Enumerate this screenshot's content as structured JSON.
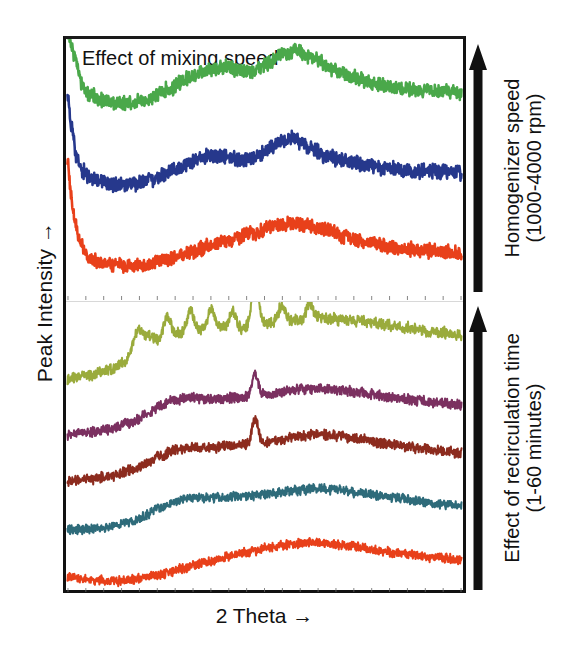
{
  "figure": {
    "title": "Effect of mixing speed",
    "xlabel": "2 Theta →",
    "ylabel": "Peak Intensity  →"
  },
  "annotations": {
    "top": {
      "line1": "Homogenizer speed",
      "line2": "(1000-4000 rpm)",
      "arrow_icon": "up-arrow-icon",
      "direction": "up"
    },
    "bottom": {
      "line1": "Effect of recirculation time",
      "line2": "(1-60 minutes)",
      "arrow_icon": "up-arrow-icon",
      "direction": "up"
    }
  },
  "chart_data": {
    "type": "line",
    "title": "Effect of mixing speed",
    "xlabel": "2 Theta →",
    "ylabel": "Peak Intensity →",
    "grid": false,
    "legend_position": "none",
    "xlim": [
      5,
      60
    ],
    "ylim": [
      0,
      1
    ],
    "axis_tick_labels_shown": false,
    "panels": [
      {
        "name": "Effect of mixing speed",
        "annotation": "Homogenizer speed (1000-4000 rpm)",
        "series": [
          {
            "name": "4000 rpm",
            "color": "#4aa84a",
            "offset": 0.74,
            "noise": 0.022,
            "profile": [
              [
                5,
                0.3
              ],
              [
                6,
                0.2
              ],
              [
                7,
                0.1
              ],
              [
                8,
                0.055
              ],
              [
                10,
                0.03
              ],
              [
                13,
                0.02
              ],
              [
                16,
                0.035
              ],
              [
                19,
                0.075
              ],
              [
                22,
                0.12
              ],
              [
                25,
                0.155
              ],
              [
                27,
                0.165
              ],
              [
                29,
                0.15
              ],
              [
                31,
                0.145
              ],
              [
                33,
                0.175
              ],
              [
                35,
                0.215
              ],
              [
                37,
                0.225
              ],
              [
                39,
                0.2
              ],
              [
                42,
                0.155
              ],
              [
                45,
                0.12
              ],
              [
                48,
                0.095
              ],
              [
                51,
                0.08
              ],
              [
                54,
                0.07
              ],
              [
                57,
                0.065
              ],
              [
                60,
                0.062
              ]
            ]
          },
          {
            "name": "2500 rpm",
            "color": "#26388c",
            "offset": 0.44,
            "noise": 0.024,
            "profile": [
              [
                5,
                0.34
              ],
              [
                5.6,
                0.22
              ],
              [
                6.2,
                0.12
              ],
              [
                7,
                0.055
              ],
              [
                8.5,
                0.02
              ],
              [
                11,
                0.005
              ],
              [
                14,
                0.005
              ],
              [
                17,
                0.022
              ],
              [
                20,
                0.06
              ],
              [
                23,
                0.1
              ],
              [
                25,
                0.118
              ],
              [
                27,
                0.112
              ],
              [
                29,
                0.1
              ],
              [
                31,
                0.105
              ],
              [
                33,
                0.14
              ],
              [
                35,
                0.175
              ],
              [
                36.5,
                0.185
              ],
              [
                38,
                0.16
              ],
              [
                41,
                0.12
              ],
              [
                44,
                0.092
              ],
              [
                47,
                0.075
              ],
              [
                50,
                0.064
              ],
              [
                54,
                0.056
              ],
              [
                57,
                0.052
              ],
              [
                60,
                0.05
              ]
            ]
          },
          {
            "name": "1000 rpm",
            "color": "#e8401a",
            "offset": 0.12,
            "noise": 0.022,
            "profile": [
              [
                5,
                0.42
              ],
              [
                5.5,
                0.28
              ],
              [
                6,
                0.18
              ],
              [
                6.8,
                0.095
              ],
              [
                8,
                0.04
              ],
              [
                10,
                0.012
              ],
              [
                13,
                0.005
              ],
              [
                16,
                0.01
              ],
              [
                19,
                0.03
              ],
              [
                22,
                0.058
              ],
              [
                25,
                0.085
              ],
              [
                28,
                0.11
              ],
              [
                31,
                0.135
              ],
              [
                34,
                0.16
              ],
              [
                36,
                0.172
              ],
              [
                38,
                0.168
              ],
              [
                41,
                0.145
              ],
              [
                44,
                0.118
              ],
              [
                47,
                0.098
              ],
              [
                50,
                0.082
              ],
              [
                54,
                0.068
              ],
              [
                57,
                0.06
              ],
              [
                60,
                0.055
              ]
            ]
          }
        ]
      },
      {
        "name": "Effect of recirculation time",
        "annotation": "Effect of recirculation time (1-60 minutes)",
        "series": [
          {
            "name": "60 minutes",
            "color": "#9aab3c",
            "offset": 0.72,
            "noise": 0.016,
            "crystalline": true,
            "profile": [
              [
                5,
                0.02
              ],
              [
                8,
                0.035
              ],
              [
                11,
                0.055
              ],
              [
                13,
                0.085
              ],
              [
                14.5,
                0.135
              ],
              [
                16,
                0.175
              ],
              [
                17.5,
                0.16
              ],
              [
                19,
                0.195
              ],
              [
                20.5,
                0.18
              ],
              [
                22,
                0.21
              ],
              [
                23.5,
                0.195
              ],
              [
                25,
                0.22
              ],
              [
                26.5,
                0.2
              ],
              [
                28,
                0.215
              ],
              [
                29.5,
                0.195
              ],
              [
                31,
                0.225
              ],
              [
                33,
                0.215
              ],
              [
                35,
                0.235
              ],
              [
                37,
                0.225
              ],
              [
                39,
                0.24
              ],
              [
                42,
                0.23
              ],
              [
                45,
                0.225
              ],
              [
                48,
                0.215
              ],
              [
                52,
                0.2
              ],
              [
                56,
                0.185
              ],
              [
                60,
                0.175
              ]
            ],
            "peaks": [
              [
                14.8,
                0.055
              ],
              [
                18.9,
                0.045
              ],
              [
                22.2,
                0.05
              ],
              [
                25.1,
                0.048
              ],
              [
                28.1,
                0.04
              ],
              [
                31.2,
                0.165
              ],
              [
                34.9,
                0.045
              ],
              [
                38.8,
                0.05
              ]
            ]
          },
          {
            "name": "30 minutes",
            "color": "#7b3060",
            "offset": 0.53,
            "noise": 0.014,
            "crystalline": true,
            "profile": [
              [
                5,
                0.015
              ],
              [
                8,
                0.022
              ],
              [
                11,
                0.035
              ],
              [
                14,
                0.058
              ],
              [
                16,
                0.085
              ],
              [
                18,
                0.118
              ],
              [
                20,
                0.138
              ],
              [
                22,
                0.145
              ],
              [
                25,
                0.142
              ],
              [
                28,
                0.145
              ],
              [
                31,
                0.15
              ],
              [
                34,
                0.16
              ],
              [
                37,
                0.172
              ],
              [
                40,
                0.178
              ],
              [
                43,
                0.172
              ],
              [
                46,
                0.162
              ],
              [
                50,
                0.148
              ],
              [
                54,
                0.135
              ],
              [
                57,
                0.125
              ],
              [
                60,
                0.118
              ]
            ],
            "peaks": [
              [
                31.2,
                0.075
              ]
            ]
          },
          {
            "name": "15 minutes",
            "color": "#8c2b1e",
            "offset": 0.37,
            "noise": 0.014,
            "crystalline": true,
            "profile": [
              [
                5,
                0.012
              ],
              [
                8,
                0.018
              ],
              [
                11,
                0.03
              ],
              [
                14,
                0.05
              ],
              [
                16,
                0.072
              ],
              [
                18,
                0.1
              ],
              [
                20,
                0.122
              ],
              [
                22,
                0.13
              ],
              [
                25,
                0.13
              ],
              [
                28,
                0.136
              ],
              [
                31,
                0.142
              ],
              [
                34,
                0.155
              ],
              [
                37,
                0.168
              ],
              [
                40,
                0.175
              ],
              [
                43,
                0.17
              ],
              [
                46,
                0.158
              ],
              [
                50,
                0.142
              ],
              [
                54,
                0.128
              ],
              [
                57,
                0.118
              ],
              [
                60,
                0.11
              ]
            ],
            "peaks": [
              [
                31.2,
                0.09
              ]
            ]
          },
          {
            "name": "5 minutes",
            "color": "#2e6b7a",
            "offset": 0.2,
            "noise": 0.013,
            "crystalline": false,
            "profile": [
              [
                5,
                0.01
              ],
              [
                8,
                0.014
              ],
              [
                11,
                0.022
              ],
              [
                14,
                0.04
              ],
              [
                16,
                0.062
              ],
              [
                18,
                0.09
              ],
              [
                20,
                0.112
              ],
              [
                22,
                0.122
              ],
              [
                25,
                0.124
              ],
              [
                28,
                0.128
              ],
              [
                31,
                0.132
              ],
              [
                34,
                0.14
              ],
              [
                37,
                0.15
              ],
              [
                40,
                0.155
              ],
              [
                43,
                0.15
              ],
              [
                46,
                0.14
              ],
              [
                50,
                0.126
              ],
              [
                54,
                0.112
              ],
              [
                57,
                0.102
              ],
              [
                60,
                0.096
              ]
            ],
            "peaks": []
          },
          {
            "name": "1 minute",
            "color": "#e8401a",
            "offset": 0.02,
            "noise": 0.013,
            "crystalline": false,
            "profile": [
              [
                5,
                0.03
              ],
              [
                7,
                0.02
              ],
              [
                9,
                0.014
              ],
              [
                12,
                0.012
              ],
              [
                15,
                0.02
              ],
              [
                18,
                0.035
              ],
              [
                21,
                0.055
              ],
              [
                24,
                0.075
              ],
              [
                27,
                0.095
              ],
              [
                30,
                0.112
              ],
              [
                33,
                0.128
              ],
              [
                36,
                0.14
              ],
              [
                39,
                0.146
              ],
              [
                42,
                0.142
              ],
              [
                45,
                0.132
              ],
              [
                48,
                0.12
              ],
              [
                52,
                0.106
              ],
              [
                56,
                0.094
              ],
              [
                60,
                0.086
              ]
            ],
            "peaks": []
          }
        ]
      }
    ]
  }
}
